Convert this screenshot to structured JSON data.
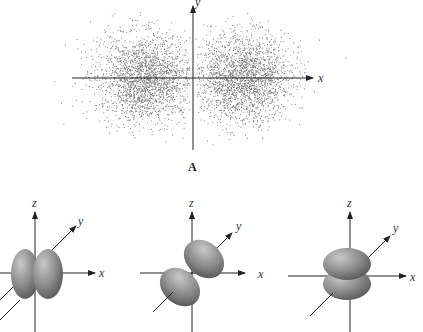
{
  "figure": {
    "panel_a": {
      "label": "A",
      "description": "Electron probability density dot plot (p orbital) in xy-plane",
      "axes": {
        "x": "x",
        "y": "y"
      },
      "colors": {
        "dots": "#7a7a7a",
        "axis": "#222222"
      }
    },
    "orbitals": [
      {
        "name": "px",
        "axes": {
          "x": "x",
          "y": "y",
          "z": "z"
        },
        "orientation": "lobes along x"
      },
      {
        "name": "py",
        "axes": {
          "x": "x",
          "y": "y",
          "z": "z"
        },
        "orientation": "lobes along y"
      },
      {
        "name": "pz",
        "axes": {
          "x": "x",
          "y": "y",
          "z": "z"
        },
        "orientation": "lobes along z"
      }
    ],
    "colors": {
      "lobe_light": "#b9b9b9",
      "lobe_mid": "#8e8e8e",
      "lobe_dark": "#5e5e5e",
      "axis": "#222222"
    }
  }
}
